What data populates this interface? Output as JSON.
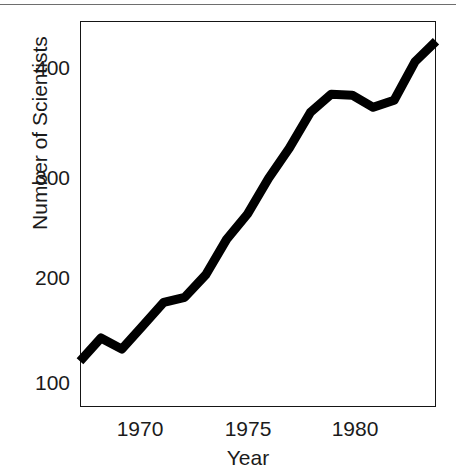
{
  "figure": {
    "background_color": "#ffffff",
    "ink_color": "#151515",
    "top_rule": "horizontal-rule"
  },
  "axes": {
    "y_ticks": [
      "100",
      "200",
      "300",
      "400"
    ],
    "x_ticks": [
      "1970",
      "1975",
      "1980"
    ],
    "x_title": "Year",
    "y_title": "Number of Scientists"
  },
  "chart_data": {
    "type": "line",
    "title": "",
    "xlabel": "Year",
    "ylabel": "Number of Scientists",
    "xlim": [
      1967,
      1984
    ],
    "ylim": [
      60,
      440
    ],
    "xticks": [
      1970,
      1975,
      1980
    ],
    "yticks": [
      100,
      200,
      300,
      400
    ],
    "grid": false,
    "legend": false,
    "line_color": "#000000",
    "line_width_px": 9,
    "x": [
      1967,
      1968,
      1969,
      1970,
      1971,
      1972,
      1973,
      1974,
      1975,
      1976,
      1977,
      1978,
      1979,
      1980,
      1981,
      1982,
      1983,
      1984
    ],
    "values": [
      105,
      128,
      117,
      140,
      163,
      168,
      190,
      225,
      250,
      285,
      315,
      350,
      368,
      367,
      355,
      362,
      400,
      420
    ],
    "series": [
      {
        "name": "Number of Scientists",
        "values": [
          105,
          128,
          117,
          140,
          163,
          168,
          190,
          225,
          250,
          285,
          315,
          350,
          368,
          367,
          355,
          362,
          400,
          420
        ]
      }
    ]
  }
}
